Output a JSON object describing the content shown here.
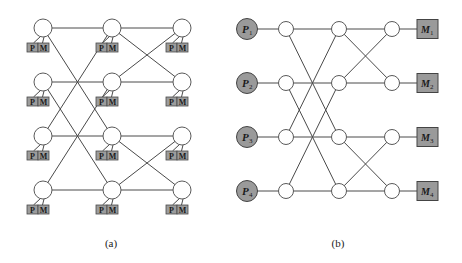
{
  "figure_a": {
    "caption": "(a)",
    "columns_x": [
      43,
      112,
      182
    ],
    "rows_y": [
      28,
      82,
      136,
      190
    ],
    "switch_radius": 9,
    "node_label_p": "P",
    "node_label_m": "M",
    "stage_links": [
      {
        "from_col": 0,
        "to_col": 1,
        "pairs": [
          [
            0,
            0
          ],
          [
            1,
            1
          ],
          [
            2,
            2
          ],
          [
            3,
            3
          ],
          [
            0,
            2
          ],
          [
            1,
            3
          ],
          [
            2,
            0
          ],
          [
            3,
            1
          ]
        ]
      },
      {
        "from_col": 1,
        "to_col": 2,
        "pairs": [
          [
            0,
            0
          ],
          [
            1,
            1
          ],
          [
            2,
            2
          ],
          [
            3,
            3
          ],
          [
            0,
            1
          ],
          [
            1,
            0
          ],
          [
            2,
            3
          ],
          [
            3,
            2
          ]
        ]
      }
    ]
  },
  "figure_b": {
    "caption": "(b)",
    "processors": [
      {
        "label": "P",
        "sub": "1"
      },
      {
        "label": "P",
        "sub": "2"
      },
      {
        "label": "P",
        "sub": "3"
      },
      {
        "label": "P",
        "sub": "4"
      }
    ],
    "memories": [
      {
        "label": "M",
        "sub": "1"
      },
      {
        "label": "M",
        "sub": "2"
      },
      {
        "label": "M",
        "sub": "3"
      },
      {
        "label": "M",
        "sub": "4"
      }
    ],
    "proc_x": 247,
    "proc_radius": 10.5,
    "switch_columns_x": [
      286,
      339,
      392
    ],
    "rows_y": [
      29,
      83,
      137,
      191
    ],
    "switch_radius": 7.5,
    "mem_box": {
      "x": 417,
      "width": 21,
      "height": 19
    },
    "stage_links": [
      {
        "from_col": 0,
        "to_col": 1,
        "pairs": [
          [
            0,
            0
          ],
          [
            1,
            1
          ],
          [
            2,
            2
          ],
          [
            3,
            3
          ],
          [
            0,
            2
          ],
          [
            1,
            3
          ],
          [
            2,
            0
          ],
          [
            3,
            1
          ]
        ]
      },
      {
        "from_col": 1,
        "to_col": 2,
        "pairs": [
          [
            0,
            0
          ],
          [
            1,
            1
          ],
          [
            2,
            2
          ],
          [
            3,
            3
          ],
          [
            0,
            1
          ],
          [
            1,
            0
          ],
          [
            2,
            3
          ],
          [
            3,
            2
          ]
        ]
      }
    ]
  },
  "colors": {
    "node_fill_gray": "#9a9a9a",
    "line": "#4a4a4a",
    "switch_fill": "#ffffff"
  }
}
